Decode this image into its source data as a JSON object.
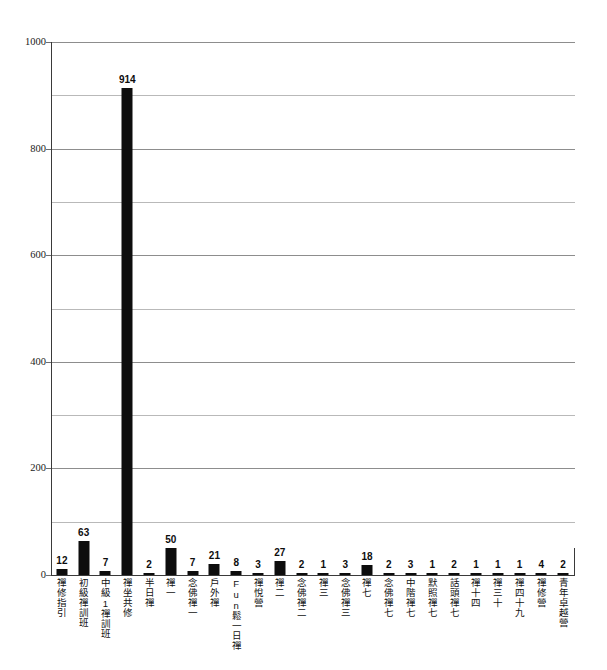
{
  "chart_data": {
    "type": "bar",
    "title": "",
    "subtitle": "",
    "xlabel": "",
    "ylabel": "",
    "ylim": [
      0,
      1000
    ],
    "grid": true,
    "legend": "none",
    "y_tick_labels": [
      "1000",
      "800",
      "600",
      "400",
      "200",
      "0"
    ],
    "y_tick_values": [
      1000,
      800,
      600,
      400,
      200,
      0
    ],
    "y_gridline_values": [
      100,
      200,
      300,
      400,
      500,
      600,
      700,
      800,
      900,
      1000
    ],
    "bar_color": "#0d0d0d",
    "grid_color": "#b9b9b9",
    "axis_color": "#3a3a3a",
    "categories": [
      "禪修指引",
      "初級禪訓班",
      "中級1禪訓班",
      "禪坐共修",
      "半日禪",
      "禪一",
      "念佛禪一",
      "戶外禪",
      "Fun鬆一日禪",
      "禪悅營",
      "禪二",
      "念佛禪二",
      "禪三",
      "念佛禪三",
      "禪七",
      "念佛禪七",
      "中階禪七",
      "默照禪七",
      "話頭禪七",
      "禪十四",
      "禪三十",
      "禪四十九",
      "禪修營",
      "青年卓越營"
    ],
    "values": [
      12,
      63,
      7,
      914,
      2,
      50,
      7,
      21,
      8,
      3,
      27,
      2,
      1,
      3,
      18,
      2,
      3,
      1,
      2,
      1,
      1,
      1,
      4,
      2
    ],
    "value_labels": [
      "12",
      "63",
      "7",
      "914",
      "2",
      "50",
      "7",
      "21",
      "8",
      "3",
      "27",
      "2",
      "1",
      "3",
      "18",
      "2",
      "3",
      "1",
      "2",
      "1",
      "1",
      "1",
      "4",
      "2"
    ]
  }
}
